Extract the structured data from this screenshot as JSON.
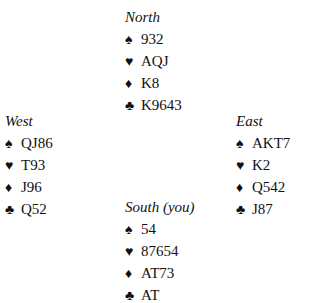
{
  "suit_symbols": {
    "spades": "♠",
    "hearts": "♥",
    "diamonds": "♦",
    "clubs": "♣"
  },
  "hands": {
    "north": {
      "label": "North",
      "spades": "932",
      "hearts": "AQJ",
      "diamonds": "K8",
      "clubs": "K9643"
    },
    "west": {
      "label": "West",
      "spades": "QJ86",
      "hearts": "T93",
      "diamonds": "J96",
      "clubs": "Q52"
    },
    "east": {
      "label": "East",
      "spades": "AKT7",
      "hearts": "K2",
      "diamonds": "Q542",
      "clubs": "J87"
    },
    "south": {
      "label": "South (you)",
      "spades": "54",
      "hearts": "87654",
      "diamonds": "AT73",
      "clubs": "AT"
    }
  }
}
